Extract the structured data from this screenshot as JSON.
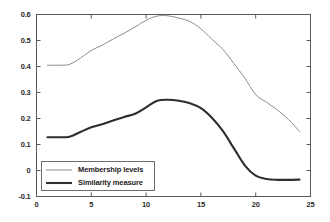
{
  "figure": {
    "background": "#ffffff",
    "axes_color": "#5a5a5a"
  },
  "chart_data": {
    "type": "line",
    "title": "",
    "xlabel": "",
    "ylabel": "",
    "xlim": [
      0,
      25
    ],
    "ylim": [
      -0.1,
      0.6
    ],
    "grid": false,
    "legend_position": "lower left",
    "xticks": [
      0,
      5,
      10,
      15,
      20,
      25
    ],
    "xtick_labels": [
      "0",
      "5",
      "10",
      "15",
      "20",
      "25"
    ],
    "yticks": [
      -0.1,
      0,
      0.1,
      0.2,
      0.3,
      0.4,
      0.5,
      0.6
    ],
    "ytick_labels": [
      "-0.1",
      "0",
      "0.1",
      "0.2",
      "0.3",
      "0.4",
      "0.5",
      "0.6"
    ],
    "x": [
      1,
      2,
      3,
      4,
      5,
      6,
      7,
      8,
      9,
      10,
      11,
      12,
      13,
      14,
      15,
      16,
      17,
      18,
      19,
      20,
      21,
      22,
      23,
      24
    ],
    "series": [
      {
        "name": "Membership levels",
        "color": "#8c8c8c",
        "width": 1.0,
        "values": [
          0.405,
          0.405,
          0.408,
          0.432,
          0.462,
          0.482,
          0.506,
          0.528,
          0.552,
          0.578,
          0.594,
          0.595,
          0.586,
          0.573,
          0.545,
          0.505,
          0.466,
          0.412,
          0.356,
          0.292,
          0.262,
          0.232,
          0.196,
          0.15
        ]
      },
      {
        "name": "Similarity measure",
        "color": "#2e2e2e",
        "width": 2.1,
        "values": [
          0.128,
          0.128,
          0.13,
          0.148,
          0.166,
          0.178,
          0.192,
          0.206,
          0.218,
          0.243,
          0.268,
          0.272,
          0.268,
          0.259,
          0.24,
          0.203,
          0.152,
          0.086,
          0.02,
          -0.02,
          -0.033,
          -0.036,
          -0.036,
          -0.035
        ]
      }
    ]
  },
  "legend": {
    "entries": [
      {
        "label": "Membership levels"
      },
      {
        "label": "Similarity measure"
      }
    ]
  }
}
